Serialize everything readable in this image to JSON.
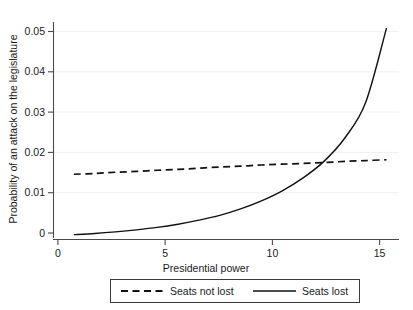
{
  "chart_data": {
    "type": "line",
    "title": "",
    "xlabel": "Presidential power",
    "ylabel": "Probability of an attack on the legislature",
    "xlim": [
      0,
      16.6
    ],
    "ylim": [
      0,
      0.055
    ],
    "xticks": [
      0,
      5,
      10,
      15
    ],
    "xticklabels": [
      "0",
      "5",
      "10",
      "15"
    ],
    "yticks": [
      0,
      0.01,
      0.02,
      0.03,
      0.04,
      0.05
    ],
    "yticklabels": [
      "0",
      "0.01",
      "0.02",
      "0.03",
      "0.04",
      "0.05"
    ],
    "grid": "horizontal-faint",
    "legend_position": "below-axes",
    "x": [
      1,
      2,
      3,
      4,
      5,
      6,
      7,
      8,
      9,
      10,
      11,
      12,
      13,
      14,
      15,
      16
    ],
    "series": [
      {
        "name": "Seats not lost",
        "style": "dashed",
        "color": "#111111",
        "values": [
          0.0162,
          0.0164,
          0.0167,
          0.0169,
          0.0172,
          0.0174,
          0.0177,
          0.018,
          0.0182,
          0.0185,
          0.0187,
          0.0189,
          0.0191,
          0.0194,
          0.0196,
          0.0198
        ]
      },
      {
        "name": "Seats lost",
        "style": "solid",
        "color": "#111111",
        "values": [
          0.0012,
          0.0015,
          0.0019,
          0.0024,
          0.003,
          0.0038,
          0.0048,
          0.006,
          0.0076,
          0.0096,
          0.0121,
          0.0153,
          0.0194,
          0.0252,
          0.034,
          0.0525
        ]
      }
    ],
    "annotations": {
      "crossover_x": 11.8,
      "crossover_y": 0.0188
    }
  },
  "legend": {
    "items": [
      {
        "label": "Seats not lost",
        "style": "dashed"
      },
      {
        "label": "Seats lost",
        "style": "solid"
      }
    ]
  }
}
